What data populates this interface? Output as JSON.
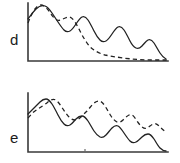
{
  "figure": {
    "background": "#ffffff",
    "ink_color": "#222222",
    "axis_color": "#3a3a3a",
    "width": 180,
    "height": 163
  },
  "panels": [
    {
      "id": "d",
      "label": "d",
      "label_x": 10,
      "label_y": 45,
      "axis": {
        "origin_x": 28,
        "origin_y": 61,
        "x_end": 168,
        "y_top": 3
      },
      "ticks": [],
      "series": [
        {
          "name": "solid-curve",
          "style": "solid",
          "path": "M 28,19 C 31,15 33,12 36,9 C 39,6 42,5 45,6 C 48,7 50,10 52,13 C 54,16 56,19 58,22 C 60,25 62,28 64,30 C 66,32 68,32 70,31 C 72,30 74,27 76,24 C 78,21 80,18 82,17 C 84,16 86,17 88,20 C 90,23 92,27 94,31 C 96,35 98,38 100,40 C 102,42 104,42 106,41 C 108,40 110,37 112,34 C 114,31 116,28 118,27 C 120,26 122,27 124,30 C 126,33 128,37 130,41 C 132,45 134,47 136,48 C 138,49 140,48 142,46 C 144,44 146,41 148,40 C 150,39 152,40 154,43 C 156,46 158,50 160,53 C 162,56 164,58 166,59"
        },
        {
          "name": "dashed-curve",
          "style": "dashed",
          "path": "M 28,23 C 30,18 32,13 35,9 C 38,5 41,4 44,6 C 47,8 49,11 51,14 C 53,17 55,19 57,20 C 59,21 61,20 63,19 C 65,18 67,17 69,17 C 71,17 73,19 75,22 C 77,25 79,29 81,33 C 83,37 85,40 87,43 C 89,46 91,48 94,50 C 97,52 101,54 105,55 C 110,56 116,57 123,58 C 131,59 142,60 152,60 C 158,60 163,60 167,60"
        }
      ]
    },
    {
      "id": "e",
      "label": "e",
      "label_x": 10,
      "label_y": 143,
      "axis": {
        "origin_x": 28,
        "origin_y": 152,
        "x_end": 168,
        "y_top": 93
      },
      "ticks": [
        {
          "x": 85,
          "y0": 150,
          "y1": 152
        }
      ],
      "series": [
        {
          "name": "solid-curve",
          "style": "solid",
          "path": "M 28,114 C 30,112 32,110 34,108 C 36,106 38,104 40,102 C 42,100 44,99 46,99 C 48,99 50,101 52,104 C 54,107 56,111 58,115 C 60,119 62,122 64,124 C 66,126 68,126 70,125 C 72,124 74,121 76,119 C 78,117 80,116 82,116 C 84,116 86,118 88,121 C 90,124 92,128 94,131 C 96,134 98,136 100,137 C 102,138 104,137 106,135 C 108,133 110,130 112,128 C 114,126 116,125 118,126 C 120,127 122,130 124,133 C 126,136 128,139 130,141 C 132,143 134,143 136,142 C 138,141 140,139 142,137 C 144,135 146,134 148,134 C 150,134 152,136 154,139 C 156,142 158,146 160,148 C 162,150 164,151 166,151"
        },
        {
          "name": "dashed-curve",
          "style": "dashed",
          "path": "M 28,118 C 30,116 32,113 35,111 C 38,109 41,107 44,105 C 47,103 49,101 51,100 C 53,99 55,99 57,101 C 59,103 61,106 63,109 C 65,112 67,115 69,117 C 71,119 73,120 75,120 C 77,120 79,119 81,117 C 83,115 85,113 87,111 C 89,109 91,106 93,104 C 95,102 97,101 99,101 C 101,101 103,103 105,106 C 107,109 109,113 111,116 C 113,119 115,121 117,122 C 119,123 121,122 123,120 C 125,118 127,116 129,115 C 131,114 133,115 135,118 C 137,121 139,124 141,126 C 143,128 145,129 147,128 C 149,127 151,125 153,124 C 155,123 157,124 159,126 C 161,128 163,130 166,132"
        }
      ]
    }
  ]
}
